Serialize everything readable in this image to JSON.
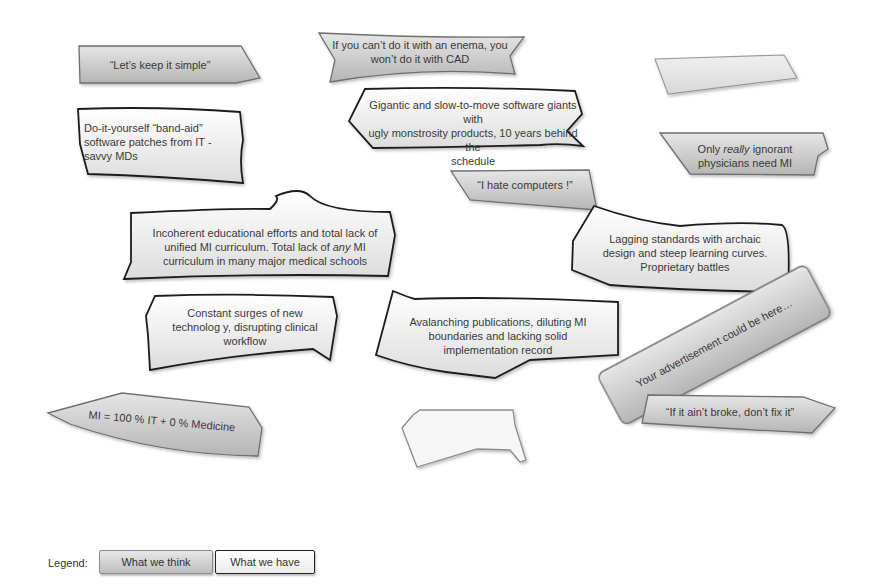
{
  "diagram": {
    "colors": {
      "think_fill_top": "#e6e6e6",
      "think_fill_bottom": "#b5b5b5",
      "have_fill_top": "#ffffff",
      "have_fill_bottom": "#dcdcdc",
      "have_stroke": "#1e1e1e",
      "think_stroke": "#6f6f6f"
    },
    "callouts": [
      {
        "id": "keep-simple",
        "type": "what-we-think",
        "text": "“Let’s keep it simple”"
      },
      {
        "id": "enema-cad",
        "type": "what-we-think",
        "line1": "If you can’t do it with an enema, you",
        "line2": "won’t do it with CAD"
      },
      {
        "id": "blank-top-right",
        "type": "what-we-think",
        "text": ""
      },
      {
        "id": "band-aid",
        "type": "what-we-have",
        "line1": "Do-it-yourself “band-aid”",
        "line2": "software patches from IT -",
        "line3": "savvy MDs"
      },
      {
        "id": "software-giants",
        "type": "what-we-have",
        "line1": "Gigantic and slow-to-move software giants with",
        "line2": "ugly monstrosity products, 10 years behind the",
        "line3": "schedule"
      },
      {
        "id": "ignorant-physicians",
        "type": "what-we-think",
        "line1_pre": "Only ",
        "line1_em": "really",
        "line1_post": " ignorant",
        "line2": "physicians need MI"
      },
      {
        "id": "hate-computers",
        "type": "what-we-think",
        "text": "“I hate computers !”"
      },
      {
        "id": "curriculum",
        "type": "what-we-have",
        "line1": "Incoherent educational efforts and total lack of",
        "line2_pre": "unified MI curriculum. Total lack of ",
        "line2_em": "any",
        "line2_post": " MI",
        "line3": "curriculum in many major medical schools"
      },
      {
        "id": "standards",
        "type": "what-we-have",
        "line1": "Lagging standards with archaic",
        "line2": "design and steep learning curves.",
        "line3": "Proprietary battles"
      },
      {
        "id": "technology-surges",
        "type": "what-we-have",
        "line1": "Constant surges of new",
        "line2": "technolog y, disrupting clinical",
        "line3": "workflow"
      },
      {
        "id": "publications",
        "type": "what-we-have",
        "line1": "Avalanching publications, diluting MI",
        "line2": "boundaries and lacking solid",
        "line3": "implementation record"
      },
      {
        "id": "advertisement",
        "type": "what-we-think",
        "text": "Your advertisement could be here…"
      },
      {
        "id": "mi-equation",
        "type": "what-we-think",
        "text": "MI = 100 % IT + 0 % Medicine"
      },
      {
        "id": "blank-bottom",
        "type": "what-we-have",
        "text": ""
      },
      {
        "id": "aint-broke",
        "type": "what-we-think",
        "text": "“If it ain’t broke, don’t fix it”"
      }
    ]
  },
  "legend": {
    "title": "Legend:",
    "items": [
      {
        "label": "What we think",
        "type": "what-we-think"
      },
      {
        "label": "What we have",
        "type": "what-we-have"
      }
    ]
  }
}
